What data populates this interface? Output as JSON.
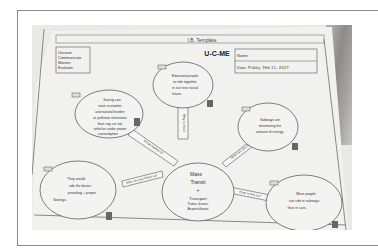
{
  "worksheet": {
    "header_bar": "I.B. Template",
    "title": "U-C-ME",
    "left_box": [
      "Uncover",
      "Communicate",
      "Monitor",
      "Evaluate"
    ],
    "name_label": "Name:",
    "date_label": "Date:",
    "date_value": "Friday, Feb 11, 2017"
  },
  "center": {
    "line1": "Mass",
    "line2": "Transit",
    "line3": "+",
    "line4": "Transport",
    "line5": "Trains, buses,",
    "line6": "Airports/boats"
  },
  "bubbles": [
    {
      "id": "top",
      "lines": [
        "Educated people",
        "to ride together",
        "in our less social",
        "future."
      ]
    },
    {
      "id": "upper-left",
      "lines": [
        "Saving can",
        "ease economic",
        "and natural burden",
        "or pollution emissions",
        "than say car ots",
        "vehicles under power",
        "consumption"
      ]
    },
    {
      "id": "upper-right",
      "lines": [
        "Subways are",
        "minimizing the",
        "amount of energy."
      ]
    },
    {
      "id": "lower-left",
      "lines": [
        "They would",
        "ride the buses",
        "providing + proper",
        "Savings."
      ]
    },
    {
      "id": "lower-right",
      "lines": [
        "More people",
        "can ride in subways",
        "than in cars."
      ]
    }
  ],
  "connectors": [
    {
      "id": "to-top",
      "text": "Why is this?"
    },
    {
      "id": "to-upper-left",
      "text": "What makes it?"
    },
    {
      "id": "to-upper-right",
      "text": "How can you tell?"
    },
    {
      "id": "to-lower-left",
      "text": "Why do you think so?"
    },
    {
      "id": "to-lower-right",
      "text": "How is this so?"
    }
  ]
}
